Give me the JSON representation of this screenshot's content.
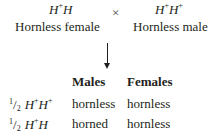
{
  "cross": {
    "female": {
      "genotype_base": "H",
      "genotype": [
        "H",
        "+",
        "H",
        ""
      ],
      "label": "Hornless female"
    },
    "symbol": "×",
    "male": {
      "genotype": [
        "H",
        "+",
        "H",
        "+"
      ],
      "label": "Hornless male"
    }
  },
  "table": {
    "headers": [
      "Males",
      "Females"
    ],
    "rows": [
      {
        "fraction_num": "1",
        "fraction_den": "2",
        "genotype": [
          "H",
          "+",
          "H",
          "+"
        ],
        "males": "hornless",
        "females": "hornless"
      },
      {
        "fraction_num": "1",
        "fraction_den": "2",
        "genotype": [
          "H",
          "+",
          "H",
          ""
        ],
        "males": "horned",
        "females": "hornless"
      }
    ]
  }
}
